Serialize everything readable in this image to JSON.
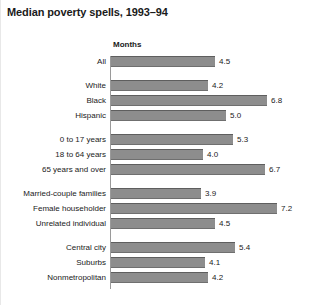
{
  "chart_data": {
    "type": "bar",
    "title": "Median poverty spells, 1993–94",
    "xlabel": "Months",
    "ylabel": "",
    "orientation": "horizontal",
    "grid": false,
    "legend": null,
    "xlim": [
      0,
      7.6
    ],
    "axis_header": "Months",
    "groups": [
      {
        "name": "total",
        "rows": [
          {
            "category": "All",
            "value": 4.5,
            "value_label": "4.5"
          }
        ]
      },
      {
        "name": "race-ethnicity",
        "rows": [
          {
            "category": "White",
            "value": 4.2,
            "value_label": "4.2"
          },
          {
            "category": "Black",
            "value": 6.8,
            "value_label": "6.8"
          },
          {
            "category": "Hispanic",
            "value": 5.0,
            "value_label": "5.0"
          }
        ]
      },
      {
        "name": "age",
        "rows": [
          {
            "category": "0 to 17 years",
            "value": 5.3,
            "value_label": "5.3"
          },
          {
            "category": "18 to 64 years",
            "value": 4.0,
            "value_label": "4.0"
          },
          {
            "category": "65 years and over",
            "value": 6.7,
            "value_label": "6.7"
          }
        ]
      },
      {
        "name": "household-type",
        "rows": [
          {
            "category": "Married-couple families",
            "value": 3.9,
            "value_label": "3.9"
          },
          {
            "category": "Female householder",
            "value": 7.2,
            "value_label": "7.2"
          },
          {
            "category": "Unrelated individual",
            "value": 4.5,
            "value_label": "4.5"
          }
        ]
      },
      {
        "name": "residence",
        "rows": [
          {
            "category": "Central city",
            "value": 5.4,
            "value_label": "5.4"
          },
          {
            "category": "Suburbs",
            "value": 4.1,
            "value_label": "4.1"
          },
          {
            "category": "Nonmetropolitan",
            "value": 4.2,
            "value_label": "4.2"
          }
        ]
      }
    ],
    "categories": [
      "All",
      "White",
      "Black",
      "Hispanic",
      "0 to 17 years",
      "18 to 64 years",
      "65 years and over",
      "Married-couple families",
      "Female householder",
      "Unrelated individual",
      "Central city",
      "Suburbs",
      "Nonmetropolitan"
    ],
    "values": [
      4.5,
      4.2,
      6.8,
      5.0,
      5.3,
      4.0,
      6.7,
      3.9,
      7.2,
      4.5,
      5.4,
      4.1,
      4.2
    ],
    "colors": {
      "bar_fill": "#8d8d8d",
      "bar_edge": "#5e5e5e",
      "text": "#1a1a1a",
      "background": "#ffffff",
      "axis": "#9a9a9a"
    }
  },
  "layout": {
    "bar_origin_x": 110,
    "px_per_unit": 23.0,
    "row_height": 12,
    "row_pitch": 15,
    "group_gap": 9,
    "plot_top": 56
  }
}
